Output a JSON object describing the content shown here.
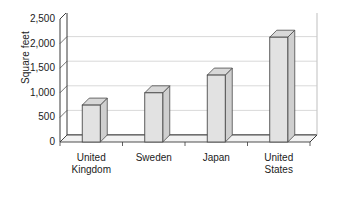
{
  "chart_data": {
    "type": "bar",
    "title": "",
    "subtitle": "",
    "xlabel": "",
    "ylabel": "Square feet",
    "categories": [
      "United Kingdom",
      "Sweden",
      "Japan",
      "United States"
    ],
    "category_lines": [
      [
        "United",
        "Kingdom"
      ],
      [
        "Sweden"
      ],
      [
        "Japan"
      ],
      [
        "United",
        "States"
      ]
    ],
    "values": [
      750,
      1000,
      1360,
      2130
    ],
    "ylim": [
      0,
      2500
    ],
    "ytick_values": [
      0,
      500,
      1000,
      1500,
      2000,
      2500
    ],
    "ytick_labels": [
      "0",
      "500",
      "1,000",
      "1,500",
      "2,000",
      "2,500"
    ],
    "grid": true,
    "grid_axis": "y",
    "legend": false,
    "legend_position": "none",
    "style": "3d-column",
    "bar_face_color": "#e2e2e2",
    "bar_side_color": "#cfcfcf",
    "bar_top_color": "#d8d8d8",
    "bar_edge_color": "#4a4a4a",
    "grid_color": "#c8c8c8",
    "axis_color": "#3a3a3a",
    "plot_background": "#ffffff",
    "text_color": "#1b1b1b"
  },
  "credit": {
    "text": "© CENGAGE LEARNING 2012"
  }
}
